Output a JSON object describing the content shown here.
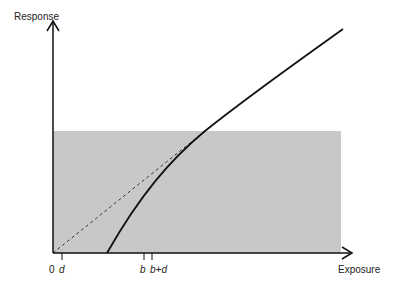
{
  "diagram": {
    "y_axis_label": "Response",
    "x_axis_label": "Exposure",
    "ticks": [
      {
        "label": "0",
        "x": 53,
        "italic": false
      },
      {
        "label": "d",
        "x": 62,
        "italic": true
      },
      {
        "label": "b",
        "x": 144,
        "italic": true
      },
      {
        "label": "b+d",
        "x": 152,
        "italic": true
      }
    ],
    "shaded_region_color": "#c8c8c8",
    "curve_color": "#111111",
    "dashed_line_color": "#333333"
  }
}
